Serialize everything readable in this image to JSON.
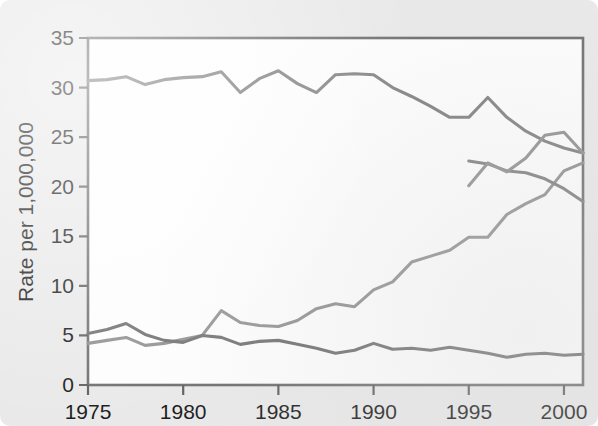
{
  "figure": {
    "background_color": "#e9e9e9",
    "plot_background_color": "#fdfdfd",
    "frame_color": "#6f6f6f"
  },
  "chart_data": {
    "type": "line",
    "title": "",
    "subtitle": "",
    "xlabel": "",
    "ylabel": "Rate per 1,000,000",
    "xlim": [
      1975,
      2001
    ],
    "ylim": [
      0,
      35
    ],
    "yticks": [
      0,
      5,
      10,
      15,
      20,
      25,
      30,
      35
    ],
    "ytick_labels": [
      "0",
      "5",
      "10",
      "15",
      "20",
      "25",
      "30",
      "35"
    ],
    "xticks": [
      1975,
      1980,
      1985,
      1990,
      1995,
      2000
    ],
    "xtick_labels": [
      "1975",
      "1980",
      "1985",
      "1990",
      "1995",
      "2000"
    ],
    "grid": false,
    "legend": false,
    "legend_position": "none",
    "x": [
      1975,
      1976,
      1977,
      1978,
      1979,
      1980,
      1981,
      1982,
      1983,
      1984,
      1985,
      1986,
      1987,
      1988,
      1989,
      1990,
      1991,
      1992,
      1993,
      1994,
      1995,
      1996,
      1997,
      1998,
      1999,
      2000,
      2001
    ],
    "series": [
      {
        "name": "declining-series",
        "color": "#808080",
        "values": [
          30.7,
          30.8,
          31.1,
          30.3,
          30.8,
          31.0,
          31.1,
          31.6,
          29.5,
          30.9,
          31.7,
          30.4,
          29.5,
          31.3,
          31.4,
          31.3,
          30.0,
          29.1,
          28.1,
          27.0,
          27.0,
          29.0,
          27.0,
          25.6,
          24.6,
          23.9,
          23.4
        ],
        "values_alt": []
      },
      {
        "name": "rising-series",
        "color": "#909090",
        "values": [
          4.2,
          4.5,
          4.8,
          4.0,
          4.2,
          4.6,
          5.0,
          7.5,
          6.3,
          6.0,
          5.9,
          6.5,
          7.7,
          8.2,
          7.9,
          9.6,
          10.4,
          12.4,
          13.0,
          13.6,
          14.9,
          14.9,
          17.2,
          18.3,
          19.2,
          21.6,
          22.4
        ],
        "values_alt": []
      },
      {
        "name": "flat-low-series",
        "color": "#707070",
        "values": [
          5.2,
          5.6,
          6.2,
          5.1,
          4.5,
          4.3,
          5.0,
          4.8,
          4.1,
          4.4,
          4.5,
          4.1,
          3.7,
          3.2,
          3.5,
          4.2,
          3.6,
          3.7,
          3.5,
          3.8,
          3.5,
          3.2,
          2.8,
          3.1,
          3.2,
          3.0,
          3.1
        ]
      }
    ],
    "series_segments": {
      "declining_tail": {
        "name": "declining-tail",
        "x": [
          1995,
          1996,
          1997,
          1998,
          1999,
          2000,
          2001
        ],
        "values": [
          22.6,
          22.3,
          21.6,
          21.4,
          20.8,
          19.8,
          18.5
        ]
      },
      "rising_tail": {
        "name": "rising-tail",
        "x": [
          1995,
          1996,
          1997,
          1998,
          1999,
          2000,
          2001
        ],
        "values": [
          20.1,
          22.4,
          21.5,
          22.9,
          25.2,
          25.5,
          23.4
        ]
      }
    }
  }
}
